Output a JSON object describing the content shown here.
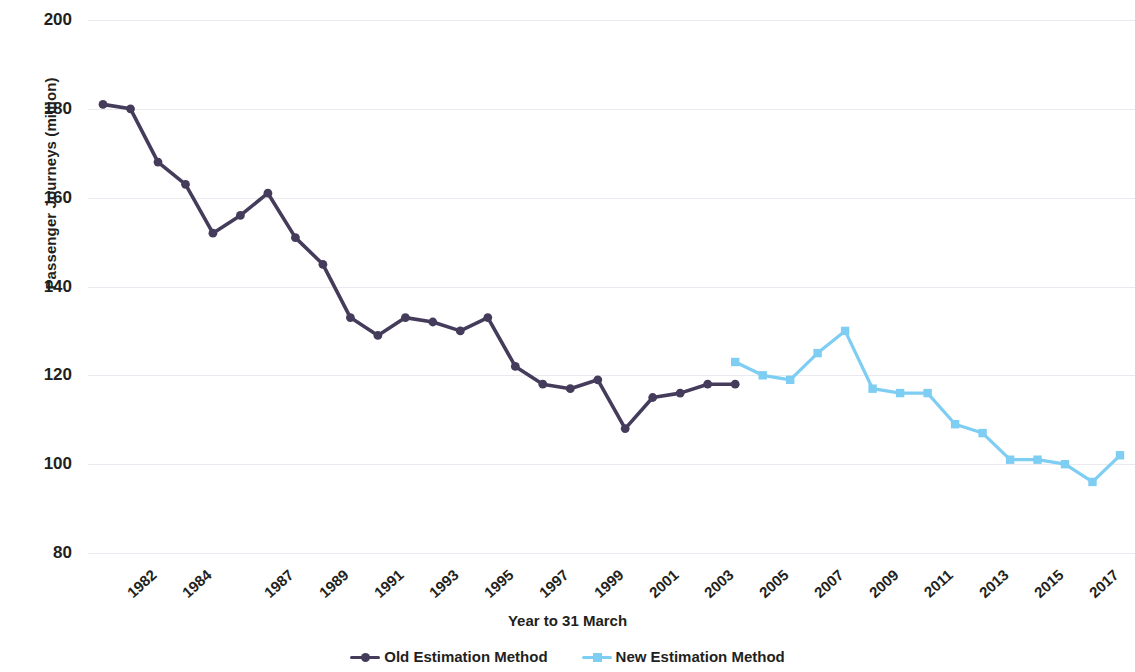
{
  "chart_data": {
    "type": "line",
    "title": "",
    "xlabel": "Year to 31 March",
    "ylabel": "Passenger Journeys (million)",
    "ylim": [
      80,
      200
    ],
    "yticks": [
      200,
      180,
      160,
      140,
      120,
      100,
      80
    ],
    "grid": true,
    "legend_position": "bottom",
    "x": [
      1982,
      1983,
      1984,
      1985,
      1986,
      1987,
      1988,
      1989,
      1990,
      1991,
      1992,
      1993,
      1994,
      1995,
      1996,
      1997,
      1998,
      1999,
      2000,
      2001,
      2002,
      2003,
      2004,
      2005,
      2006,
      2007,
      2008,
      2009,
      2010,
      2011,
      2012,
      2013,
      2014,
      2015,
      2016,
      2017,
      2018,
      2019
    ],
    "xtick_labels": [
      "1982",
      "1984",
      "1987",
      "1989",
      "1991",
      "1993",
      "1995",
      "1997",
      "1999",
      "2001",
      "2003",
      "2005",
      "2007",
      "2009",
      "2011",
      "2013",
      "2015",
      "2017",
      "2019"
    ],
    "xtick_years": [
      1982,
      1984,
      1987,
      1989,
      1991,
      1993,
      1995,
      1997,
      1999,
      2001,
      2003,
      2005,
      2007,
      2009,
      2011,
      2013,
      2015,
      2017,
      2019
    ],
    "series": [
      {
        "name": "Old Estimation Method",
        "color": "#453c5c",
        "marker": "circle",
        "x": [
          1982,
          1983,
          1984,
          1985,
          1986,
          1987,
          1988,
          1989,
          1990,
          1991,
          1992,
          1993,
          1994,
          1995,
          1996,
          1997,
          1998,
          1999,
          2000,
          2001,
          2002,
          2003,
          2004,
          2005
        ],
        "values": [
          181,
          180,
          168,
          163,
          152,
          156,
          161,
          151,
          145,
          133,
          129,
          133,
          132,
          130,
          133,
          122,
          118,
          117,
          119,
          108,
          115,
          116,
          118,
          118
        ]
      },
      {
        "name": "New Estimation Method",
        "color": "#7ecdf2",
        "marker": "square",
        "x": [
          2005,
          2006,
          2007,
          2008,
          2009,
          2010,
          2011,
          2012,
          2013,
          2014,
          2015,
          2016,
          2017,
          2018,
          2019
        ],
        "values": [
          123,
          120,
          119,
          125,
          130,
          117,
          116,
          116,
          109,
          107,
          101,
          101,
          100,
          96,
          102
        ]
      }
    ]
  },
  "legend": {
    "items": [
      {
        "label": "Old Estimation Method",
        "color": "#453c5c",
        "marker": "circle"
      },
      {
        "label": "New Estimation Method",
        "color": "#7ecdf2",
        "marker": "square"
      }
    ]
  },
  "axes": {
    "y_title": "Passenger Journeys (million)",
    "x_title": "Year to 31 March"
  }
}
